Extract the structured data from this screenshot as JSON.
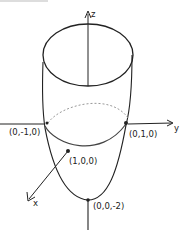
{
  "diagram": {
    "style": "hand-drawn sketch",
    "axes": {
      "z_label": "z",
      "y_label": "y",
      "x_label": "x"
    },
    "points": [
      {
        "id": "neg-y",
        "label": "(0,-1,0)"
      },
      {
        "id": "pos-y",
        "label": "(0,1,0)"
      },
      {
        "id": "pos-x",
        "label": "(1,0,0)"
      },
      {
        "id": "vertex",
        "label": "(0,0,-2)"
      }
    ],
    "colors": {
      "ink": "#222222",
      "dashed": "#999999",
      "background": "#ffffff"
    }
  }
}
